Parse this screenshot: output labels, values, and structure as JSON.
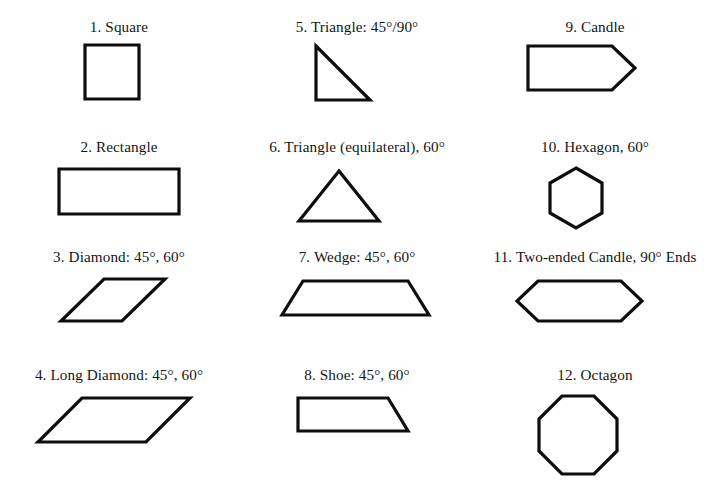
{
  "page": {
    "background_color": "#ffffff",
    "stroke_color": "#0d0d0d",
    "fill_color": "#ffffff",
    "text_color": "#151515",
    "columns": 3,
    "rows": 4,
    "total_shapes": 12
  },
  "shapes": [
    {
      "index": "1",
      "label": "1. Square",
      "name": "square",
      "col": 0,
      "row": 0,
      "viewbox": "0 0 238 96",
      "points": "85,5 139,5 139,59 85,59",
      "closed": true
    },
    {
      "index": "5",
      "label": "5. Triangle: 45°/90°",
      "name": "triangle-45-90",
      "col": 1,
      "row": 0,
      "viewbox": "0 0 238 96",
      "points": "78,6 132,60 78,60",
      "closed": true
    },
    {
      "index": "9",
      "label": "9. Candle",
      "name": "candle",
      "col": 2,
      "row": 0,
      "viewbox": "0 0 238 96",
      "points": "52,6 136,6 159,28 136,50 52,50",
      "closed": true
    },
    {
      "index": "2",
      "label": "2. Rectangle",
      "name": "rectangle",
      "col": 0,
      "row": 1,
      "viewbox": "0 0 238 96",
      "points": "59,9 179,9 179,54 59,54",
      "closed": true
    },
    {
      "index": "6",
      "label": "6. Triangle (equilateral), 60°",
      "name": "triangle-equilateral",
      "col": 1,
      "row": 1,
      "viewbox": "0 0 238 96",
      "points": "101,11 141,61 61,61",
      "closed": true
    },
    {
      "index": "10",
      "label": "10. Hexagon, 60°",
      "name": "hexagon",
      "col": 2,
      "row": 1,
      "viewbox": "0 0 238 96",
      "points": "100,8 126,23 126,53 100,68 74,53 74,23",
      "closed": true
    },
    {
      "index": "3",
      "label": "3. Diamond: 45°, 60°",
      "name": "diamond",
      "col": 0,
      "row": 2,
      "viewbox": "0 0 238 96",
      "points": "104,9 165,9 122,51 61,51",
      "closed": true
    },
    {
      "index": "7",
      "label": "7. Wedge: 45°, 60°",
      "name": "wedge",
      "col": 1,
      "row": 2,
      "viewbox": "0 0 238 96",
      "points": "65,11 170,11 191,45 44,45",
      "closed": true
    },
    {
      "index": "11",
      "label": "11. Two-ended Candle, 90° Ends",
      "name": "two-ended-candle",
      "col": 2,
      "row": 2,
      "viewbox": "0 0 238 96",
      "points": "62,11 145,11 166,31 145,51 62,51 41,31",
      "closed": true
    },
    {
      "index": "4",
      "label": "4. Long Diamond: 45°, 60°",
      "name": "long-diamond",
      "col": 0,
      "row": 3,
      "viewbox": "0 0 238 96",
      "points": "82,10 190,10 146,54 38,54",
      "closed": true
    },
    {
      "index": "8",
      "label": "8. Shoe: 45°, 60°",
      "name": "shoe",
      "col": 1,
      "row": 3,
      "viewbox": "0 0 238 96",
      "points": "60,10 150,10 170,43 60,43",
      "closed": true
    },
    {
      "index": "12",
      "label": "12. Octagon",
      "name": "octagon",
      "col": 2,
      "row": 3,
      "viewbox": "0 0 238 96",
      "points": "86,8 118,8 141,31 141,63 118,86 86,86 63,63 63,31",
      "closed": true
    }
  ]
}
